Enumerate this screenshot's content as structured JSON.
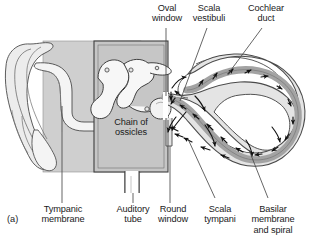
{
  "figure": {
    "panel_label": "(a)",
    "title_internal": "Chain of ossicles",
    "labels": {
      "oval_window": "Oval\nwindow",
      "scala_vestibuli": "Scala\nvestibuli",
      "cochlear_duct": "Cochlear\nduct",
      "tympanic_membrane": "Tympanic\nmembrane",
      "auditory_tube": "Auditory\ntube",
      "round_window": "Round\nwindow",
      "scala_tympani": "Scala\ntympani",
      "basilar_membrane": "Basilar\nmembrane\nand spiral",
      "chain_of_ossicles": "Chain of\nossicles"
    },
    "colors": {
      "background": "#ffffff",
      "outline": "#3c3c3c",
      "tissue_light": "#ececec",
      "bone_fill": "#f4f4f4",
      "cavity_gray": "#c6c6c6",
      "band_gray": "#cfcfcf",
      "duct_dark": "#a3a3a3",
      "arrow": "#111111",
      "text": "#1a1a1a"
    },
    "arrow_count_cochlea": 22,
    "diagram_type": "anatomical-cross-section"
  }
}
